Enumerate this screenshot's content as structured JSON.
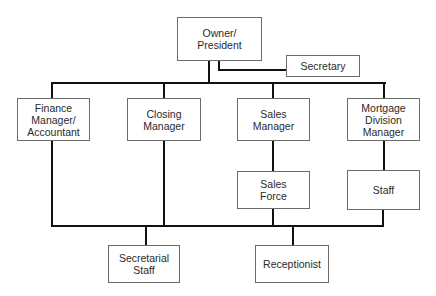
{
  "diagram": {
    "type": "org-chart",
    "nodes": {
      "owner": "Owner/\nPresident",
      "secretary": "Secretary",
      "finance": "Finance\nManager/\nAccountant",
      "closing": "Closing\nManager",
      "sales": "Sales\nManager",
      "mortgage": "Mortgage\nDivision\nManager",
      "sales_force": "Sales\nForce",
      "staff": "Staff",
      "secretarial_staff": "Secretarial\nStaff",
      "receptionist": "Receptionist"
    },
    "edges": [
      [
        "owner",
        "secretary"
      ],
      [
        "owner",
        "finance"
      ],
      [
        "owner",
        "closing"
      ],
      [
        "owner",
        "sales"
      ],
      [
        "owner",
        "mortgage"
      ],
      [
        "sales",
        "sales_force"
      ],
      [
        "mortgage",
        "staff"
      ],
      [
        "finance",
        "secretarial_staff"
      ],
      [
        "closing",
        "secretarial_staff"
      ],
      [
        "sales_force",
        "receptionist"
      ],
      [
        "staff",
        "receptionist"
      ]
    ]
  }
}
